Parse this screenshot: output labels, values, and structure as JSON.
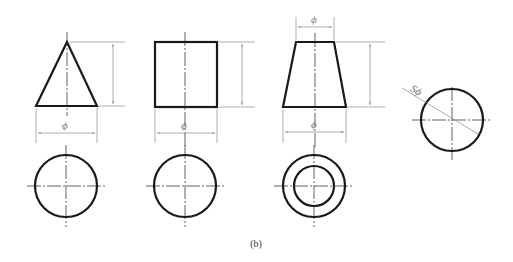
{
  "caption": "(b)",
  "labels": {
    "phi": "ϕ",
    "sphere_phi": "Sϕ"
  },
  "colors": {
    "outline": "#1a1a1a",
    "dimension": "#8a8a8a",
    "centerline": "#3a3a3a",
    "background": "#ffffff"
  },
  "figures": [
    {
      "name": "cone",
      "front_view": "triangle",
      "top_view": "circle",
      "dimensions": [
        "height",
        "ϕ base"
      ]
    },
    {
      "name": "cylinder",
      "front_view": "rectangle",
      "top_view": "circle",
      "dimensions": [
        "height",
        "ϕ"
      ]
    },
    {
      "name": "frustum",
      "front_view": "trapezoid",
      "top_view": "two concentric circles",
      "dimensions": [
        "height",
        "ϕ top",
        "ϕ bottom"
      ]
    },
    {
      "name": "sphere",
      "front_view": "circle",
      "dimensions": [
        "Sϕ"
      ]
    }
  ]
}
